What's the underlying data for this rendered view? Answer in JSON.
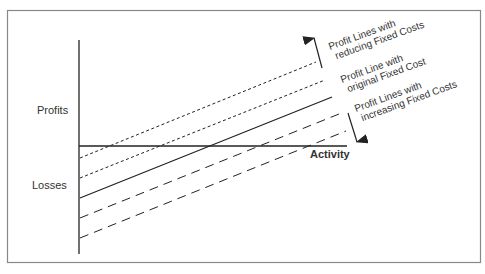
{
  "diagram": {
    "y_axis_labels": {
      "top": "Profits",
      "bottom": "Losses"
    },
    "x_axis_label": "Activity",
    "annotations": {
      "reducing": [
        "Profit Lines with",
        "reducing Fixed Costs"
      ],
      "original": [
        "Profit Line with",
        "original Fixed Cost"
      ],
      "increasing": [
        "Profit Lines with",
        "increasing Fixed Costs"
      ]
    },
    "lines": [
      {
        "name": "reduced-fixed-cost-2",
        "style": "dotted"
      },
      {
        "name": "reduced-fixed-cost-1",
        "style": "dotted"
      },
      {
        "name": "original-fixed-cost",
        "style": "solid"
      },
      {
        "name": "increased-fixed-cost-1",
        "style": "dashed"
      },
      {
        "name": "increased-fixed-cost-2",
        "style": "dashed"
      }
    ],
    "colors": {
      "line": "#222222",
      "border": "#888888",
      "text": "#333333"
    }
  }
}
